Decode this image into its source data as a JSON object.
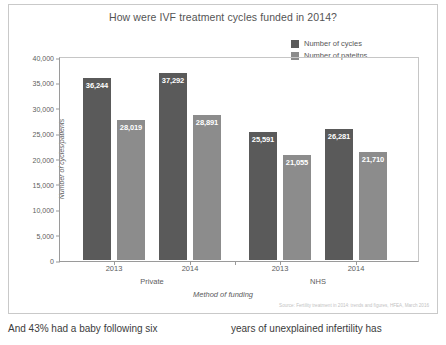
{
  "chart_data": {
    "type": "bar",
    "title": "How were IVF treatment cycles funded in 2014?",
    "xlabel": "Method of funding",
    "ylabel": "Number of cycles/patients",
    "ylim": [
      0,
      40000
    ],
    "ytick_labels": [
      "40,000",
      "35,000",
      "30,000",
      "25,000",
      "20,000",
      "15,000",
      "10,000",
      "5,000",
      "0"
    ],
    "ytick_values": [
      40000,
      35000,
      30000,
      25000,
      20000,
      15000,
      10000,
      5000,
      0
    ],
    "grid": false,
    "legend_position": "top-right",
    "categories": [
      "2013",
      "2014",
      "2013",
      "2014"
    ],
    "groups": [
      {
        "name": "Private",
        "categories": [
          "2013",
          "2014"
        ]
      },
      {
        "name": "NHS",
        "categories": [
          "2013",
          "2014"
        ]
      }
    ],
    "series": [
      {
        "name": "Number of cycles",
        "color": "#5a5a5a",
        "values": [
          36244,
          37292,
          25591,
          26281
        ],
        "labels": [
          "36,244",
          "37,292",
          "25,591",
          "26,281"
        ]
      },
      {
        "name": "Number of pateitns",
        "color": "#8c8c8c",
        "values": [
          28019,
          28891,
          21055,
          21710
        ],
        "labels": [
          "28,019",
          "28,891",
          "21,055",
          "21,710"
        ]
      }
    ],
    "source": "Source: Fertility treatment in 2014: trends and figures, HFEA, March 2016"
  },
  "body_text": {
    "left_column": "And 43% had a baby following six",
    "right_column": "years of unexplained infertility has"
  }
}
